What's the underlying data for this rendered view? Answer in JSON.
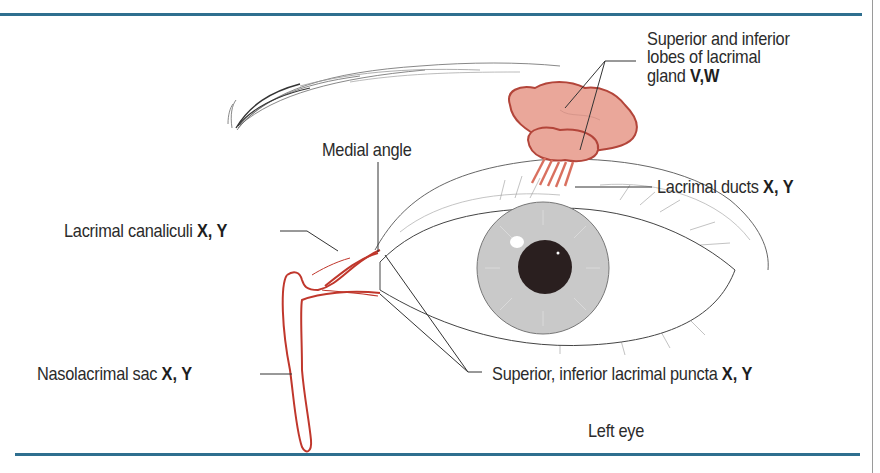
{
  "figure": {
    "caption": "Left eye",
    "rule_color": "#2f6f8f",
    "gland_color": "#e8a396",
    "duct_color": "#c0372c"
  },
  "labels": {
    "lacrimal_gland": {
      "line1": "Superior and inferior",
      "line2": "lobes of lacrimal",
      "line3": "gland",
      "tag": "V,W"
    },
    "medial_angle": {
      "text": "Medial angle"
    },
    "lacrimal_ducts": {
      "text": "Lacrimal ducts",
      "tag": "X, Y"
    },
    "lacrimal_canaliculi": {
      "text": "Lacrimal canaliculi",
      "tag": "X, Y"
    },
    "nasolacrimal_sac": {
      "text": "Nasolacrimal sac",
      "tag": "X, Y"
    },
    "lacrimal_puncta": {
      "text": "Superior, inferior lacrimal puncta",
      "tag": "X, Y"
    }
  }
}
